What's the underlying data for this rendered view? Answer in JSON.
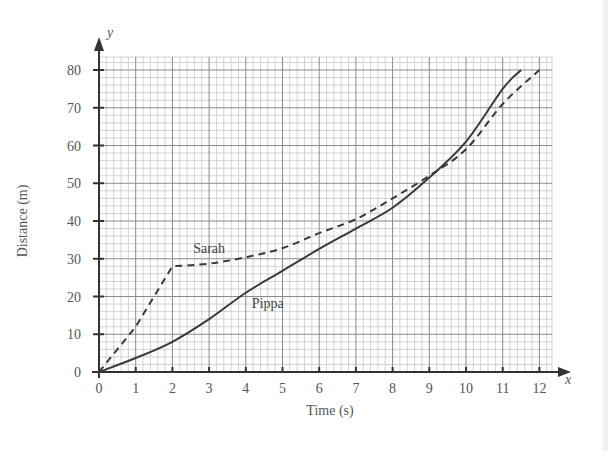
{
  "chart_data": {
    "type": "line",
    "title": "",
    "xlabel": "Time (s)",
    "ylabel": "Distance (m)",
    "x_axis_var": "x",
    "y_axis_var": "y",
    "xlim": [
      0,
      12
    ],
    "ylim": [
      0,
      80
    ],
    "x_ticks": [
      0,
      1,
      2,
      3,
      4,
      5,
      6,
      7,
      8,
      9,
      10,
      11,
      12
    ],
    "y_ticks": [
      0,
      10,
      20,
      30,
      40,
      50,
      60,
      70,
      80
    ],
    "grid": true,
    "grid_minor": {
      "x_step": 0.2,
      "y_step": 2
    },
    "legend": "inline labels",
    "series": [
      {
        "name": "Sarah",
        "style": "dashed",
        "label_pos": [
          3,
          31.5
        ],
        "x": [
          0,
          1,
          2,
          3,
          4,
          5,
          6,
          7,
          8,
          9,
          10,
          11,
          12
        ],
        "values": [
          0,
          12,
          28,
          28.7,
          30.4,
          32.8,
          36.8,
          40.5,
          46,
          52,
          59,
          71,
          80
        ]
      },
      {
        "name": "Pippa",
        "style": "solid",
        "label_pos": [
          4.6,
          17
        ],
        "x": [
          0,
          1,
          2,
          3,
          4,
          5,
          6,
          7,
          8,
          9,
          10,
          11,
          11.5
        ],
        "values": [
          0,
          3.7,
          8,
          14,
          21,
          26.8,
          32.6,
          38,
          43.5,
          51.5,
          61,
          75,
          80
        ]
      }
    ]
  },
  "colors": {
    "axis": "#333333",
    "grid_major": "#8a8a8a",
    "grid_minor": "#c8c8c8",
    "line": "#3a3a3a",
    "text": "#555555"
  }
}
